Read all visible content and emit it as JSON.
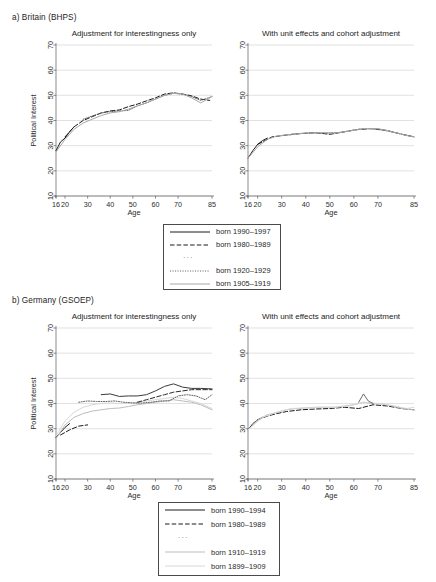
{
  "figure": {
    "sections": [
      {
        "id": "britain",
        "header": "a) Britain (BHPS)"
      },
      {
        "id": "germany",
        "header": "b) Germany (GSOEP)"
      }
    ],
    "panel_titles": {
      "left": "Adjustment for interestingness only",
      "right": "With unit effects and cohort adjustment"
    },
    "axis": {
      "xlabel": "Age",
      "ylabel": "Political Interest",
      "xticks": [
        16,
        20,
        30,
        40,
        50,
        60,
        70,
        85
      ],
      "xticklabels": [
        "16",
        "20",
        "30",
        "40",
        "50",
        "60",
        "70",
        "85"
      ],
      "yticks": [
        10,
        20,
        30,
        40,
        50,
        60,
        70
      ],
      "yticklabels": [
        "10",
        "20",
        "30",
        "40",
        "50",
        "60",
        "70"
      ],
      "xlim": [
        16,
        85
      ],
      "ylim": [
        10,
        70
      ]
    },
    "legends": {
      "britain": {
        "entries": [
          {
            "label": "born 1990–1997",
            "style": "solid",
            "color": "#1a1a1a",
            "width": 1.0
          },
          {
            "label": "born 1980–1989",
            "style": "dashed",
            "color": "#1a1a1a",
            "width": 1.0
          },
          {
            "label": "···",
            "style": "ellipsis",
            "color": "#6a6a6a",
            "width": 0
          },
          {
            "label": "born 1920–1929",
            "style": "dotted",
            "color": "#555555",
            "width": 0.9
          },
          {
            "label": "born 1905–1919",
            "style": "solid",
            "color": "#a8a8a8",
            "width": 1.0
          }
        ]
      },
      "germany": {
        "entries": [
          {
            "label": "born 1990–1994",
            "style": "solid",
            "color": "#1a1a1a",
            "width": 1.0
          },
          {
            "label": "born 1980–1989",
            "style": "dashed",
            "color": "#1a1a1a",
            "width": 1.0
          },
          {
            "label": "···",
            "style": "ellipsis",
            "color": "#6a6a6a",
            "width": 0
          },
          {
            "label": "born 1910–1919",
            "style": "solid",
            "color": "#bdbdbd",
            "width": 1.0
          },
          {
            "label": "born 1899–1909",
            "style": "solid",
            "color": "#d8d8d8",
            "width": 1.0
          }
        ]
      }
    }
  },
  "chart_data": [
    {
      "id": "britain-left",
      "type": "line",
      "title": "Adjustment for interestingness only",
      "panel": "a) Britain (BHPS)",
      "xlabel": "Age",
      "ylabel": "Political Interest",
      "xlim": [
        16,
        85
      ],
      "ylim": [
        10,
        70
      ],
      "grid": true,
      "legend_position": "below-figure",
      "series": [
        {
          "name": "born 1990–1997",
          "style": "solid",
          "color": "#1a1a1a",
          "x": [
            16,
            18,
            20,
            22,
            24
          ],
          "values": [
            28.0,
            31.5,
            33.0,
            35.5,
            37.5
          ]
        },
        {
          "name": "born 1980–1989",
          "style": "dashed",
          "color": "#1a1a1a",
          "x": [
            20,
            24,
            28,
            32,
            36,
            40,
            44,
            48,
            52,
            56,
            60,
            64,
            68,
            72,
            76,
            80,
            84
          ],
          "values": [
            33.5,
            37.5,
            40.0,
            41.5,
            43.0,
            43.8,
            44.2,
            45.5,
            46.5,
            47.8,
            49.0,
            50.5,
            51.0,
            50.5,
            49.8,
            48.5,
            48.0
          ]
        },
        {
          "name": "born 1920–1929",
          "style": "dotted",
          "color": "#555555",
          "x": [
            28,
            32,
            36,
            40,
            44,
            48,
            52,
            56,
            60,
            64,
            68,
            72,
            76,
            80,
            85
          ],
          "values": [
            40.5,
            41.8,
            43.0,
            43.5,
            43.8,
            44.0,
            45.8,
            47.0,
            48.5,
            50.0,
            50.8,
            50.5,
            49.5,
            48.0,
            49.5
          ]
        },
        {
          "name": "born 1905–1919",
          "style": "solid",
          "color": "#a8a8a8",
          "x": [
            16,
            20,
            24,
            28,
            32,
            36,
            40,
            44,
            48,
            52,
            56,
            60,
            64,
            68,
            72,
            76,
            80,
            85
          ],
          "values": [
            27.5,
            32.5,
            36.5,
            39.0,
            40.5,
            42.0,
            43.0,
            43.5,
            44.5,
            45.8,
            47.0,
            48.5,
            50.0,
            50.8,
            50.5,
            49.0,
            47.0,
            49.5
          ]
        }
      ]
    },
    {
      "id": "britain-right",
      "type": "line",
      "title": "With unit effects and cohort adjustment",
      "panel": "a) Britain (BHPS)",
      "xlabel": "Age",
      "ylabel": "Political Interest",
      "xlim": [
        16,
        85
      ],
      "ylim": [
        10,
        70
      ],
      "grid": true,
      "legend_position": "below-figure",
      "series": [
        {
          "name": "born 1990–1997",
          "style": "solid",
          "color": "#1a1a1a",
          "x": [
            16,
            18,
            20,
            22,
            24
          ],
          "values": [
            25.0,
            28.0,
            30.5,
            32.0,
            33.0
          ]
        },
        {
          "name": "born 1980–1989",
          "style": "dashed",
          "color": "#1a1a1a",
          "x": [
            20,
            26,
            32,
            38,
            44,
            50,
            56,
            62,
            68,
            74,
            80,
            85
          ],
          "values": [
            30.5,
            33.5,
            34.2,
            34.8,
            35.2,
            34.5,
            35.5,
            36.5,
            36.8,
            36.0,
            34.5,
            33.5
          ]
        },
        {
          "name": "born 1920–1929",
          "style": "dotted",
          "color": "#555555",
          "x": [
            30,
            36,
            42,
            48,
            54,
            60,
            66,
            72,
            78,
            85
          ],
          "values": [
            34.0,
            34.8,
            35.0,
            35.0,
            35.2,
            36.2,
            36.8,
            36.2,
            35.0,
            33.5
          ]
        },
        {
          "name": "born 1905–1919",
          "style": "solid",
          "color": "#a8a8a8",
          "x": [
            16,
            20,
            24,
            28,
            34,
            40,
            46,
            52,
            58,
            64,
            70,
            76,
            82,
            85
          ],
          "values": [
            25.0,
            29.5,
            32.5,
            33.8,
            34.5,
            35.0,
            35.2,
            35.0,
            35.8,
            36.8,
            36.8,
            35.5,
            34.0,
            33.5
          ]
        }
      ]
    },
    {
      "id": "germany-left",
      "type": "line",
      "title": "Adjustment for interestingness only",
      "panel": "b) Germany (GSOEP)",
      "xlabel": "Age",
      "ylabel": "Political Interest",
      "xlim": [
        16,
        85
      ],
      "ylim": [
        10,
        70
      ],
      "grid": true,
      "legend_position": "below-figure",
      "series": [
        {
          "name": "born 1990–1994",
          "style": "solid",
          "color": "#1a1a1a",
          "x": [
            16,
            18,
            20,
            22
          ],
          "values": [
            26.5,
            28.5,
            30.5,
            32.0
          ]
        },
        {
          "name": "born 1980–1989",
          "style": "dashed",
          "color": "#1a1a1a",
          "x": [
            18,
            22,
            26,
            30
          ],
          "values": [
            27.5,
            29.5,
            31.0,
            31.5
          ]
        },
        {
          "name": "born 1910–1919",
          "style": "solid",
          "color": "#bdbdbd",
          "x": [
            16,
            20,
            24,
            28,
            32,
            36,
            40,
            44,
            48,
            52,
            56,
            60,
            64,
            68,
            72,
            76,
            80,
            85
          ],
          "values": [
            26.0,
            31.5,
            34.5,
            36.0,
            37.0,
            37.5,
            38.0,
            38.2,
            38.8,
            39.5,
            40.0,
            40.5,
            41.0,
            41.5,
            41.0,
            40.5,
            39.5,
            37.5
          ]
        },
        {
          "name": "born 1899–1909",
          "style": "solid",
          "color": "#d8d8d8",
          "x": [
            16,
            20,
            24,
            28,
            32,
            36,
            40,
            44,
            48,
            52,
            56,
            60,
            64,
            68,
            72,
            76,
            80,
            85
          ],
          "values": [
            27.0,
            33.0,
            36.5,
            38.5,
            39.5,
            40.0,
            40.2,
            40.0,
            40.2,
            40.5,
            41.0,
            41.5,
            42.0,
            42.5,
            42.0,
            41.0,
            40.0,
            38.0
          ]
        },
        {
          "name": "cohort-mid-solid",
          "style": "solid",
          "color": "#3a3a3a",
          "x": [
            36,
            40,
            44,
            48,
            52,
            56,
            60,
            64,
            68,
            72,
            76,
            80,
            85
          ],
          "values": [
            43.5,
            43.8,
            42.8,
            43.0,
            43.0,
            43.5,
            45.0,
            46.8,
            47.8,
            46.5,
            46.0,
            46.0,
            45.8
          ]
        },
        {
          "name": "cohort-mid-dashed",
          "style": "dashed",
          "color": "#2a2a2a",
          "x": [
            52,
            56,
            60,
            64,
            68,
            72,
            76,
            80,
            85
          ],
          "values": [
            40.5,
            41.5,
            42.5,
            43.5,
            44.5,
            45.0,
            45.5,
            45.5,
            45.5
          ]
        },
        {
          "name": "cohort-old-dotted",
          "style": "dotted",
          "color": "#555555",
          "x": [
            26,
            30,
            34,
            38,
            42,
            46,
            50,
            54,
            58,
            62,
            66,
            70,
            74,
            78,
            82,
            85
          ],
          "values": [
            40.5,
            41.0,
            40.8,
            40.8,
            41.0,
            40.5,
            40.2,
            40.2,
            40.5,
            41.0,
            41.0,
            43.0,
            43.5,
            43.0,
            41.5,
            43.5
          ]
        }
      ]
    },
    {
      "id": "germany-right",
      "type": "line",
      "title": "With unit effects and cohort adjustment",
      "panel": "b) Germany (GSOEP)",
      "xlabel": "Age",
      "ylabel": "Political Interest",
      "xlim": [
        16,
        85
      ],
      "ylim": [
        10,
        70
      ],
      "grid": true,
      "legend_position": "below-figure",
      "series": [
        {
          "name": "born 1990–1994",
          "style": "solid",
          "color": "#1a1a1a",
          "x": [
            16,
            18,
            20,
            22
          ],
          "values": [
            29.5,
            32.0,
            33.5,
            34.5
          ]
        },
        {
          "name": "born 1980–1989",
          "style": "dashed",
          "color": "#1a1a1a",
          "x": [
            20,
            24,
            28,
            32,
            38,
            44,
            50,
            56,
            62,
            68,
            74,
            80,
            85
          ],
          "values": [
            33.5,
            35.0,
            36.0,
            36.8,
            37.5,
            37.8,
            38.0,
            38.5,
            38.0,
            39.5,
            39.0,
            38.0,
            37.5
          ]
        },
        {
          "name": "born 1910–1919",
          "style": "solid",
          "color": "#bdbdbd",
          "x": [
            16,
            20,
            24,
            28,
            32,
            36,
            40,
            44,
            48,
            52,
            56,
            60,
            64,
            68,
            72,
            76,
            80,
            85
          ],
          "values": [
            29.5,
            33.5,
            35.5,
            36.5,
            37.5,
            38.0,
            38.2,
            38.5,
            38.5,
            38.5,
            39.0,
            39.5,
            40.5,
            40.0,
            39.8,
            39.0,
            38.0,
            37.5
          ]
        },
        {
          "name": "born 1899–1909",
          "style": "solid",
          "color": "#d8d8d8",
          "x": [
            16,
            22,
            28,
            34,
            40,
            46,
            52,
            58,
            64,
            70,
            76,
            82,
            85
          ],
          "values": [
            29.5,
            34.5,
            36.5,
            38.0,
            38.2,
            38.5,
            38.5,
            39.0,
            40.5,
            40.0,
            39.2,
            38.0,
            38.5
          ]
        },
        {
          "name": "cohort-spike",
          "style": "solid",
          "color": "#6a6a6a",
          "x": [
            62,
            64,
            66,
            68
          ],
          "values": [
            40.5,
            43.8,
            41.0,
            40.0
          ]
        }
      ]
    }
  ]
}
